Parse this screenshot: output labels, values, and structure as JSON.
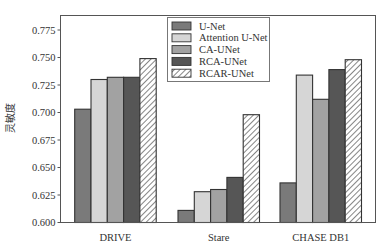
{
  "chart_data": {
    "type": "bar",
    "title": "",
    "xlabel": "",
    "ylabel": "灵敏度",
    "ylim": [
      0.6,
      0.785
    ],
    "yticks": [
      0.6,
      0.625,
      0.65,
      0.675,
      0.7,
      0.725,
      0.75,
      0.775
    ],
    "ytick_labels": [
      "0.600",
      "0.625",
      "0.650",
      "0.675",
      "0.700",
      "0.725",
      "0.750",
      "0.775"
    ],
    "categories": [
      "DRIVE",
      "Stare",
      "CHASE DB1"
    ],
    "series": [
      {
        "name": "U-Net",
        "values": [
          0.703,
          0.611,
          0.636
        ],
        "color": "#7a7a7a",
        "hatch": false
      },
      {
        "name": "Attention U-Net",
        "values": [
          0.73,
          0.628,
          0.734
        ],
        "color": "#d6d6d6",
        "hatch": false
      },
      {
        "name": "CA-UNet",
        "values": [
          0.732,
          0.63,
          0.712
        ],
        "color": "#a2a2a2",
        "hatch": false
      },
      {
        "name": "RCA-UNet",
        "values": [
          0.732,
          0.641,
          0.739
        ],
        "color": "#565656",
        "hatch": false
      },
      {
        "name": "RCAR-UNet",
        "values": [
          0.749,
          0.698,
          0.748
        ],
        "color": "#ffffff",
        "hatch": true
      }
    ],
    "grid": false,
    "legend_position": "upper center"
  }
}
